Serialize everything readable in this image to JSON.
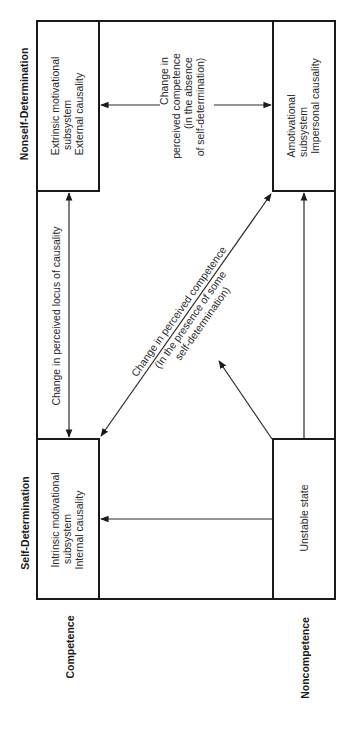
{
  "axes": {
    "top_label": "Nonself-Determination",
    "bottom_label": "Self-Determination",
    "left_label": "Competence",
    "right_label": "Noncompetence"
  },
  "boxes": {
    "extrinsic": [
      "Extrinsic motivational",
      "subsystem",
      "External causality"
    ],
    "amotivational": [
      "Amotivational",
      "subsystem",
      "Impersonal causality"
    ],
    "intrinsic": [
      "Intrinsic motivational",
      "subsystem",
      "Internal causality"
    ],
    "unstable": [
      "Unstable state"
    ]
  },
  "arrows": {
    "absence": [
      "Change in",
      "perceived competence",
      "(in the absence",
      "of self-determination)"
    ],
    "locus": "Change in perceived locus of causality",
    "presence": [
      "Change in perceived competence",
      "(In the presence of some",
      "self-determination)"
    ]
  }
}
